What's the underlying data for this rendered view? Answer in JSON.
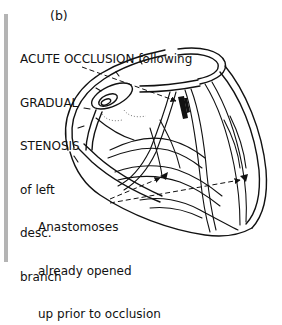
{
  "figure": {
    "label": "(b)"
  },
  "annotations": {
    "top": {
      "lines": [
        "ACUTE OCCLUSION following",
        "GRADUAL",
        "STENOSIS",
        "of left",
        "desc.",
        "branch"
      ]
    },
    "bottom": {
      "lines": [
        "Anastomoses",
        "already opened",
        "up prior to occlusion"
      ]
    }
  },
  "illustration": {
    "subject": "heart-with-coronary-arteries",
    "line_color": "#111111",
    "leader_style": "dashed-arrow",
    "sidebar_color": "#b4b4b4"
  }
}
